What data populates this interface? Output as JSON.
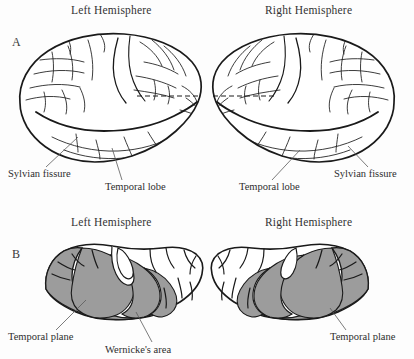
{
  "figure": {
    "background_color": "#fdfdfd",
    "ink_color": "#1a1a1a",
    "shading_color": "#9c9c9c",
    "leader_color": "#5a5a5a"
  },
  "panels": [
    {
      "letter": "A",
      "view": "lateral surface of the cerebral hemispheres",
      "headings": {
        "left": "Left Hemisphere",
        "right": "Right Hemisphere"
      },
      "labels": {
        "left_sylvian": "Sylvian fissure",
        "left_temporal": "Temporal lobe",
        "right_temporal": "Temporal lobe",
        "right_sylvian": "Sylvian fissure"
      }
    },
    {
      "letter": "B",
      "view": "superior surface of the temporal lobe",
      "headings": {
        "left": "Left Hemisphere",
        "right": "Right Hemisphere"
      },
      "labels": {
        "left_plane": "Temporal plane",
        "wernicke": "Wernicke's area",
        "right_plane": "Temporal plane"
      }
    }
  ]
}
